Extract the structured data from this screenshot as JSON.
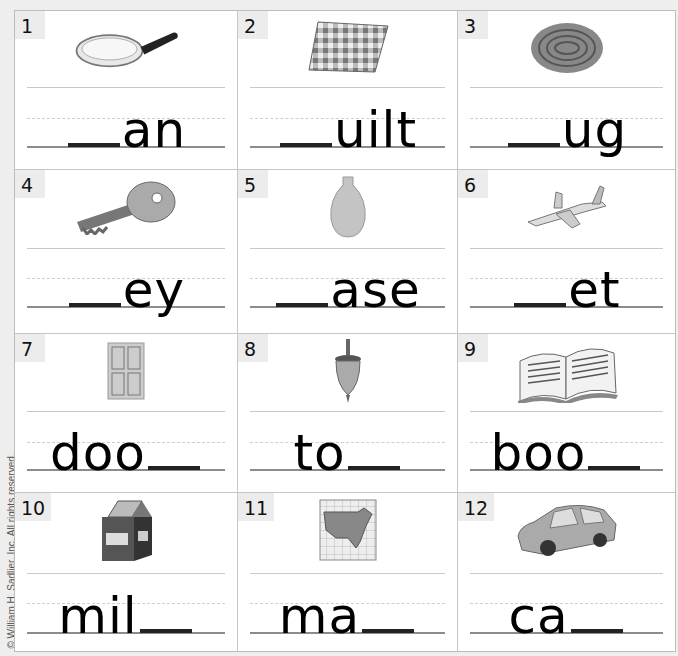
{
  "worksheet": {
    "copyright": "© William H. Sadlier, Inc. All rights reserved.",
    "items": [
      {
        "number": "1",
        "picture": "frying-pan",
        "before": "",
        "after": "an",
        "blank_position": "start"
      },
      {
        "number": "2",
        "picture": "quilt",
        "before": "",
        "after": "uilt",
        "blank_position": "start"
      },
      {
        "number": "3",
        "picture": "rug",
        "before": "",
        "after": "ug",
        "blank_position": "start"
      },
      {
        "number": "4",
        "picture": "key",
        "before": "",
        "after": "ey",
        "blank_position": "start"
      },
      {
        "number": "5",
        "picture": "vase",
        "before": "",
        "after": "ase",
        "blank_position": "start"
      },
      {
        "number": "6",
        "picture": "jet",
        "before": "",
        "after": "et",
        "blank_position": "start"
      },
      {
        "number": "7",
        "picture": "door",
        "before": "doo",
        "after": "",
        "blank_position": "end"
      },
      {
        "number": "8",
        "picture": "top",
        "before": "to",
        "after": "",
        "blank_position": "end"
      },
      {
        "number": "9",
        "picture": "book",
        "before": "boo",
        "after": "",
        "blank_position": "end"
      },
      {
        "number": "10",
        "picture": "milk",
        "before": "mil",
        "after": "",
        "blank_position": "end"
      },
      {
        "number": "11",
        "picture": "map",
        "before": "ma",
        "after": "",
        "blank_position": "end"
      },
      {
        "number": "12",
        "picture": "car",
        "before": "ca",
        "after": "",
        "blank_position": "end"
      }
    ]
  },
  "colors": {
    "background": "#eeeeee",
    "cell": "#ffffff",
    "grid_line": "#c6c6c6",
    "number_tab": "#ececec",
    "text": "#000000"
  }
}
